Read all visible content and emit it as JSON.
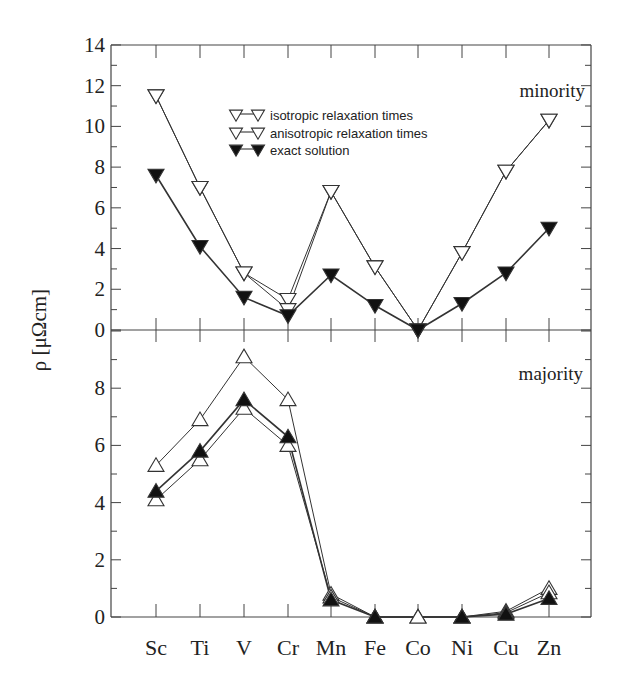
{
  "chart_data": {
    "type": "line",
    "ylabel": "ρ [μΩcm]",
    "xlabel": "",
    "categories": [
      "Sc",
      "Ti",
      "V",
      "Cr",
      "Mn",
      "Fe",
      "Co",
      "Ni",
      "Cu",
      "Zn"
    ],
    "legend": [
      {
        "label": "isotropic relaxation times",
        "marker": "open-triangle"
      },
      {
        "label": "anisotropic relaxation times",
        "marker": "open-triangle"
      },
      {
        "label": "exact solution",
        "marker": "filled-triangle"
      }
    ],
    "panels": [
      {
        "name": "minority",
        "label": "minority",
        "marker_direction": "down",
        "ylim": [
          0,
          14
        ],
        "yticks": [
          0,
          2,
          4,
          6,
          8,
          10,
          12,
          14
        ],
        "series": [
          {
            "name": "isotropic relaxation times",
            "values": [
              11.5,
              7.0,
              2.8,
              1.5,
              6.8,
              3.1,
              0.0,
              3.8,
              7.8,
              10.3
            ]
          },
          {
            "name": "anisotropic relaxation times",
            "values": [
              11.5,
              7.0,
              2.8,
              1.0,
              6.8,
              3.1,
              0.0,
              3.8,
              7.8,
              10.3
            ]
          },
          {
            "name": "exact solution",
            "values": [
              7.6,
              4.1,
              1.6,
              0.7,
              2.7,
              1.2,
              0.0,
              1.3,
              2.8,
              5.0
            ]
          }
        ]
      },
      {
        "name": "majority",
        "label": "majority",
        "marker_direction": "up",
        "ylim": [
          0,
          10
        ],
        "yticks": [
          0,
          2,
          4,
          6,
          8
        ],
        "series": [
          {
            "name": "isotropic relaxation times",
            "values": [
              5.3,
              6.9,
              9.1,
              7.6,
              0.8,
              0.0,
              0.0,
              0.0,
              0.2,
              1.0
            ]
          },
          {
            "name": "anisotropic relaxation times",
            "values": [
              4.1,
              5.5,
              7.3,
              6.0,
              0.7,
              0.0,
              0.0,
              0.0,
              0.15,
              0.85
            ]
          },
          {
            "name": "exact solution",
            "values": [
              4.4,
              5.8,
              7.6,
              6.3,
              0.6,
              0.0,
              null,
              0.0,
              0.1,
              0.65
            ]
          }
        ]
      }
    ]
  },
  "colors": {
    "line": "#333333",
    "open_fill": "#ffffff",
    "filled": "#111111",
    "axis": "#444444",
    "text": "#222222"
  }
}
